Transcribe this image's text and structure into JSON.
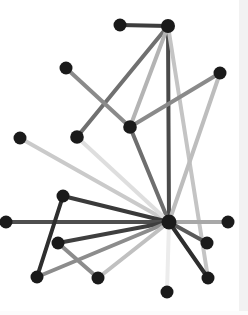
{
  "figure": {
    "width": 248,
    "height": 315,
    "background_color": "#ffffff",
    "margin_strip_color": "#f2f2f2"
  },
  "chart_data": {
    "type": "scatter",
    "subtitle": "",
    "xlabel": "",
    "ylabel": "",
    "grid": false,
    "legend_position": "none",
    "xlim": [
      0,
      248
    ],
    "ylim": [
      0,
      315
    ],
    "node_color": "#1a1a1a",
    "node_radius": 6.5,
    "nodes": [
      {
        "id": "hub",
        "x": 169,
        "y": 222,
        "r": 7.5,
        "color": "#1a1a1a"
      },
      {
        "id": "top_left",
        "x": 120,
        "y": 25,
        "r": 6.5,
        "color": "#1a1a1a"
      },
      {
        "id": "top_right",
        "x": 168,
        "y": 26,
        "r": 7.0,
        "color": "#1a1a1a"
      },
      {
        "id": "up_left",
        "x": 66,
        "y": 68,
        "r": 6.5,
        "color": "#1a1a1a"
      },
      {
        "id": "up_right",
        "x": 220,
        "y": 73,
        "r": 6.5,
        "color": "#1a1a1a"
      },
      {
        "id": "mid",
        "x": 130,
        "y": 127,
        "r": 6.8,
        "color": "#1a1a1a"
      },
      {
        "id": "far_left",
        "x": 20,
        "y": 138,
        "r": 6.5,
        "color": "#1a1a1a"
      },
      {
        "id": "left_mid",
        "x": 77,
        "y": 137,
        "r": 6.8,
        "color": "#1a1a1a"
      },
      {
        "id": "left_low",
        "x": 63,
        "y": 196,
        "r": 6.5,
        "color": "#1a1a1a"
      },
      {
        "id": "west",
        "x": 6,
        "y": 222,
        "r": 6.5,
        "color": "#1a1a1a"
      },
      {
        "id": "east",
        "x": 228,
        "y": 222,
        "r": 6.5,
        "color": "#1a1a1a"
      },
      {
        "id": "sw_upper",
        "x": 58,
        "y": 243,
        "r": 6.5,
        "color": "#1a1a1a"
      },
      {
        "id": "se_upper",
        "x": 207,
        "y": 243,
        "r": 6.5,
        "color": "#1a1a1a"
      },
      {
        "id": "sw_lower",
        "x": 37,
        "y": 277,
        "r": 6.5,
        "color": "#1a1a1a"
      },
      {
        "id": "south_mid",
        "x": 98,
        "y": 278,
        "r": 6.5,
        "color": "#1a1a1a"
      },
      {
        "id": "se_lower",
        "x": 208,
        "y": 278,
        "r": 6.5,
        "color": "#1a1a1a"
      },
      {
        "id": "south",
        "x": 167,
        "y": 292,
        "r": 6.5,
        "color": "#1a1a1a"
      }
    ],
    "edges": [
      {
        "source": "top_left",
        "target": "top_right",
        "color": "#3d3d3d",
        "width": 4.0
      },
      {
        "source": "top_right",
        "target": "hub",
        "color": "#4a4a4a",
        "width": 4.0
      },
      {
        "source": "top_right",
        "target": "left_mid",
        "color": "#707070",
        "width": 4.0
      },
      {
        "source": "top_right",
        "target": "mid",
        "color": "#b4b4b4",
        "width": 4.0
      },
      {
        "source": "top_right",
        "target": "se_lower",
        "color": "#c4c4c4",
        "width": 4.0
      },
      {
        "source": "up_left",
        "target": "mid",
        "color": "#8a8a8a",
        "width": 4.0
      },
      {
        "source": "up_right",
        "target": "mid",
        "color": "#8a8a8a",
        "width": 4.0
      },
      {
        "source": "up_right",
        "target": "hub",
        "color": "#bdbdbd",
        "width": 4.0
      },
      {
        "source": "mid",
        "target": "hub",
        "color": "#6e6e6e",
        "width": 4.0
      },
      {
        "source": "far_left",
        "target": "hub",
        "color": "#cacaca",
        "width": 4.0
      },
      {
        "source": "left_mid",
        "target": "hub",
        "color": "#dedede",
        "width": 4.0
      },
      {
        "source": "left_low",
        "target": "hub",
        "color": "#3a3a3a",
        "width": 4.0
      },
      {
        "source": "west",
        "target": "hub",
        "color": "#4f4f4f",
        "width": 4.0
      },
      {
        "source": "east",
        "target": "hub",
        "color": "#a8a8a8",
        "width": 4.0
      },
      {
        "source": "sw_upper",
        "target": "hub",
        "color": "#3f3f3f",
        "width": 4.0
      },
      {
        "source": "se_upper",
        "target": "hub",
        "color": "#5a5a5a",
        "width": 4.0
      },
      {
        "source": "sw_lower",
        "target": "hub",
        "color": "#8c8c8c",
        "width": 4.0
      },
      {
        "source": "south_mid",
        "target": "hub",
        "color": "#c0c0c0",
        "width": 4.0
      },
      {
        "source": "se_lower",
        "target": "hub",
        "color": "#2e2e2e",
        "width": 4.0
      },
      {
        "source": "south",
        "target": "hub",
        "color": "#ececec",
        "width": 4.0
      },
      {
        "source": "sw_upper",
        "target": "south_mid",
        "color": "#8c8c8c",
        "width": 4.0
      },
      {
        "source": "sw_lower",
        "target": "left_low",
        "color": "#2e2e2e",
        "width": 4.0
      }
    ]
  }
}
